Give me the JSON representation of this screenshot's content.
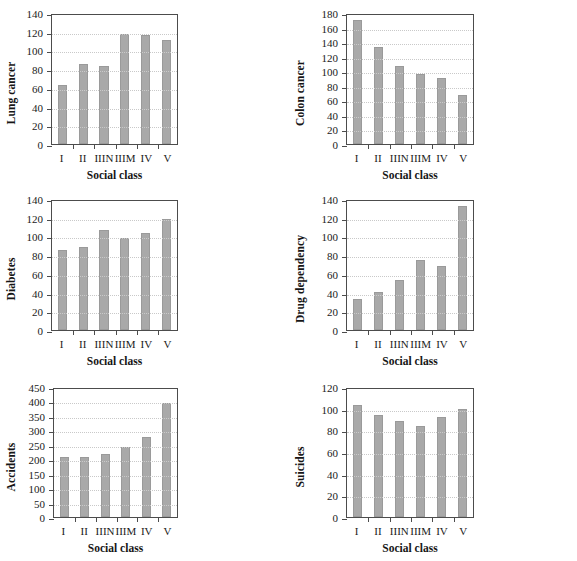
{
  "figure": {
    "xlabel": "Social class",
    "categories": [
      "I",
      "II",
      "IIIN",
      "IIIM",
      "IV",
      "V"
    ],
    "bar_color": "#a9a9a9",
    "axis_color": "#4c4c4c",
    "grid_color": "#c9c9c9",
    "grid": true,
    "legend": "none"
  },
  "chart_data": [
    {
      "type": "bar",
      "title": "",
      "ylabel": "Lung cancer",
      "xlabel": "Social class",
      "categories": [
        "I",
        "II",
        "IIIN",
        "IIIM",
        "IV",
        "V"
      ],
      "values": [
        63,
        85,
        83,
        118,
        116,
        111
      ],
      "ylim": [
        0,
        140
      ],
      "ytick_step": 20,
      "yticks": [
        0,
        20,
        40,
        60,
        80,
        100,
        120,
        140
      ],
      "grid": true,
      "legend": "none"
    },
    {
      "type": "bar",
      "title": "",
      "ylabel": "Colon cancer",
      "xlabel": "Social class",
      "categories": [
        "I",
        "II",
        "IIIN",
        "IIIM",
        "IV",
        "V"
      ],
      "values": [
        170,
        133,
        107,
        96,
        91,
        68
      ],
      "ylim": [
        0,
        180
      ],
      "ytick_step": 20,
      "yticks": [
        0,
        20,
        40,
        60,
        80,
        100,
        120,
        140,
        160,
        180
      ],
      "grid": true,
      "legend": "none"
    },
    {
      "type": "bar",
      "title": "",
      "ylabel": "Diabetes",
      "xlabel": "Social class",
      "categories": [
        "I",
        "II",
        "IIIN",
        "IIIM",
        "IV",
        "V"
      ],
      "values": [
        85,
        89,
        107,
        98,
        104,
        119
      ],
      "ylim": [
        0,
        140
      ],
      "ytick_step": 20,
      "yticks": [
        0,
        20,
        40,
        60,
        80,
        100,
        120,
        140
      ],
      "grid": true,
      "legend": "none"
    },
    {
      "type": "bar",
      "title": "",
      "ylabel": "Drug dependency",
      "xlabel": "Social class",
      "categories": [
        "I",
        "II",
        "IIIN",
        "IIIM",
        "IV",
        "V"
      ],
      "values": [
        33,
        41,
        53,
        75,
        68,
        133
      ],
      "ylim": [
        0,
        140
      ],
      "ytick_step": 20,
      "yticks": [
        0,
        20,
        40,
        60,
        80,
        100,
        120,
        140
      ],
      "grid": true,
      "legend": "none"
    },
    {
      "type": "bar",
      "title": "",
      "ylabel": "Accidents",
      "xlabel": "Social class",
      "categories": [
        "I",
        "II",
        "IIIN",
        "IIIM",
        "IV",
        "V"
      ],
      "values": [
        208,
        208,
        218,
        243,
        277,
        396
      ],
      "ylim": [
        0,
        450
      ],
      "ytick_step": 50,
      "yticks": [
        0,
        50,
        100,
        150,
        200,
        250,
        300,
        350,
        400,
        450
      ],
      "grid": true,
      "legend": "none"
    },
    {
      "type": "bar",
      "title": "",
      "ylabel": "Suicides",
      "xlabel": "Social class",
      "categories": [
        "I",
        "II",
        "IIIN",
        "IIIM",
        "IV",
        "V"
      ],
      "values": [
        103,
        94,
        89,
        84,
        92,
        100
      ],
      "ylim": [
        0,
        120
      ],
      "ytick_step": 20,
      "yticks": [
        0,
        20,
        40,
        60,
        80,
        100,
        120
      ],
      "grid": true,
      "legend": "none"
    }
  ]
}
